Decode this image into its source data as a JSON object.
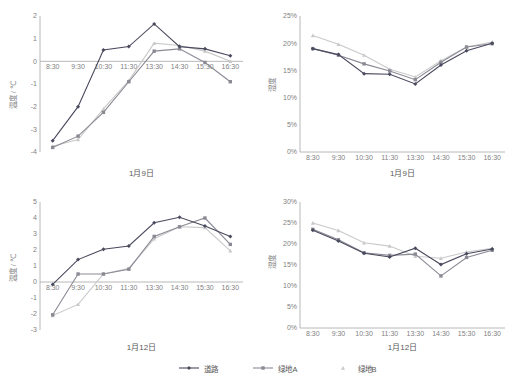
{
  "figure": {
    "background": "#ffffff",
    "series_colors": {
      "road": "#4a4a5e",
      "greenA": "#8a8a95",
      "greenB": "#c9c9c9"
    }
  },
  "legend": {
    "items": [
      {
        "label": "道路",
        "key": "road",
        "marker": "diamond",
        "color": "#4a4a5e"
      },
      {
        "label": "绿地A",
        "key": "greenA",
        "marker": "square",
        "color": "#8a8a95"
      },
      {
        "label": "绿地B",
        "key": "greenB",
        "marker": "triangle",
        "color": "#c9c9c9"
      }
    ]
  },
  "chart_data": [
    {
      "id": "temp-jan9",
      "type": "line",
      "title": "1月9日",
      "xlabel": "",
      "ylabel": "温度 / ℃",
      "ylim": [
        -4,
        2
      ],
      "yticks": [
        2,
        1,
        0,
        -1,
        -2,
        -3,
        -4
      ],
      "ytick_labels": [
        "2",
        "1",
        "0",
        "-1",
        "-2",
        "-3",
        "-4"
      ],
      "grid": false,
      "legend_position": "bottom",
      "categories": [
        "8:30",
        "9:30",
        "10:30",
        "11:30",
        "13:30",
        "14:30",
        "15:30",
        "16:30"
      ],
      "series": [
        {
          "name": "道路",
          "color": "#4a4a5e",
          "marker": "diamond",
          "values": [
            -3.5,
            -2.0,
            0.5,
            0.65,
            1.65,
            0.65,
            0.55,
            0.25
          ]
        },
        {
          "name": "绿地A",
          "color": "#8a8a95",
          "marker": "square",
          "values": [
            -3.8,
            -3.3,
            -2.25,
            -0.9,
            0.45,
            0.55,
            -0.05,
            -0.9
          ]
        },
        {
          "name": "绿地B",
          "color": "#c9c9c9",
          "marker": "triangle",
          "values": [
            -3.75,
            -3.45,
            -2.1,
            -0.85,
            0.8,
            0.7,
            0.45,
            0.0
          ]
        }
      ]
    },
    {
      "id": "humidity-jan9",
      "type": "line",
      "title": "1月9日",
      "xlabel": "",
      "ylabel": "湿度",
      "ylim": [
        0,
        25
      ],
      "yticks": [
        25,
        20,
        15,
        10,
        5,
        0
      ],
      "ytick_labels": [
        "25%",
        "20%",
        "15%",
        "10%",
        "5%",
        "0%"
      ],
      "grid": false,
      "legend_position": "bottom",
      "categories": [
        "8:30",
        "9:30",
        "10:30",
        "11:30",
        "13:30",
        "14:30",
        "15:30",
        "16:30"
      ],
      "series": [
        {
          "name": "道路",
          "color": "#4a4a5e",
          "marker": "diamond",
          "values": [
            19.0,
            17.9,
            14.4,
            14.3,
            12.5,
            16.0,
            18.6,
            20.0
          ]
        },
        {
          "name": "绿地A",
          "color": "#8a8a95",
          "marker": "square",
          "values": [
            19.0,
            17.8,
            16.2,
            14.9,
            13.3,
            16.5,
            19.3,
            19.9
          ]
        },
        {
          "name": "绿地B",
          "color": "#c9c9c9",
          "marker": "triangle",
          "values": [
            21.4,
            19.8,
            17.8,
            15.2,
            13.8,
            16.8,
            19.3,
            20.2
          ]
        }
      ]
    },
    {
      "id": "temp-jan12",
      "type": "line",
      "title": "1月12日",
      "xlabel": "",
      "ylabel": "温度 / ℃",
      "ylim": [
        -3,
        5
      ],
      "yticks": [
        5,
        4,
        3,
        2,
        1,
        0,
        -1,
        -2,
        -3
      ],
      "ytick_labels": [
        "5",
        "4",
        "3",
        "2",
        "1",
        "0",
        "-1",
        "-2",
        "-3"
      ],
      "grid": false,
      "legend_position": "bottom",
      "categories": [
        "8:30",
        "9:30",
        "10:30",
        "11:30",
        "13:30",
        "14:30",
        "15:30",
        "16:30"
      ],
      "series": [
        {
          "name": "道路",
          "color": "#4a4a5e",
          "marker": "diamond",
          "values": [
            -0.15,
            1.4,
            2.05,
            2.25,
            3.7,
            4.05,
            3.5,
            2.85
          ]
        },
        {
          "name": "绿地A",
          "color": "#8a8a95",
          "marker": "square",
          "values": [
            -2.05,
            0.5,
            0.5,
            0.8,
            2.85,
            3.45,
            4.0,
            2.35
          ]
        },
        {
          "name": "绿地B",
          "color": "#c9c9c9",
          "marker": "triangle",
          "values": [
            -2.1,
            -1.4,
            0.5,
            0.85,
            2.7,
            3.45,
            3.4,
            1.95
          ]
        }
      ]
    },
    {
      "id": "humidity-jan12",
      "type": "line",
      "title": "1月12日",
      "xlabel": "",
      "ylabel": "湿度",
      "ylim": [
        0,
        30
      ],
      "yticks": [
        30,
        25,
        20,
        15,
        10,
        5,
        0
      ],
      "ytick_labels": [
        "30%",
        "25%",
        "20%",
        "15%",
        "10%",
        "5%",
        "0%"
      ],
      "grid": false,
      "legend_position": "bottom",
      "categories": [
        "8:30",
        "9:30",
        "10:30",
        "11:30",
        "13:30",
        "14:30",
        "15:30",
        "16:30"
      ],
      "series": [
        {
          "name": "道路",
          "color": "#4a4a5e",
          "marker": "diamond",
          "values": [
            23.3,
            20.7,
            17.8,
            16.9,
            19.0,
            15.1,
            17.7,
            18.8
          ]
        },
        {
          "name": "绿地A",
          "color": "#8a8a95",
          "marker": "square",
          "values": [
            23.5,
            21.0,
            17.9,
            17.3,
            17.6,
            12.4,
            16.8,
            18.5
          ]
        },
        {
          "name": "绿地B",
          "color": "#c9c9c9",
          "marker": "triangle",
          "values": [
            25.0,
            23.2,
            20.3,
            19.5,
            17.1,
            16.6,
            18.1,
            19.0
          ]
        }
      ]
    }
  ]
}
